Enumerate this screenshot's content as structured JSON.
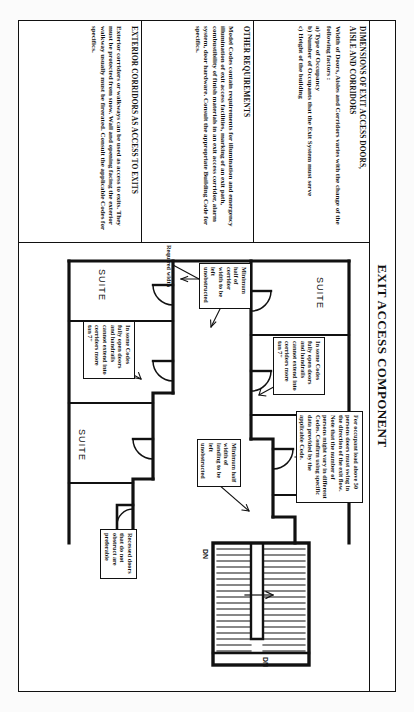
{
  "sheet": {
    "title": "EXIT ACCESS COMPONENT"
  },
  "columns": [
    {
      "id": "dimensions",
      "heading": "DIMENSIONS OF EXIT ACCESS DOORS,\nAISLE AND CORRIDORS",
      "heading_line1": "DIMENSIONS OF EXIT ACCESS DOORS,",
      "heading_line2": "AISLE AND CORRIDORS",
      "body": "Width of Doors, Aisles and Corridors varies with the change of the following factors :",
      "bullets": [
        "a) Type of Occupancy",
        "b) Number of Occupants that the Exit System  must serve",
        "c) Height of the building"
      ]
    },
    {
      "id": "other-requirements",
      "heading": "OTHER REQUIREMENTS",
      "body": "Model Codes contain requirements for illumination and emergency illumination of exit access facilities, marking of an exit path, combustibility of finish materials in an exit access corridor, alarm system, door hardware. Consult the appropriate Building Code for specifics."
    },
    {
      "id": "exterior-corridors",
      "heading": "EXTERIOR CORRIDORS AS ACCESS TO EXITS",
      "body": "Exterior corridors or walkways can be used as access to exits. They must be protected from snow. Wall and opening facing the exterior walkway usually must be firerated. Consult the applicable Codes for specifics."
    }
  ],
  "drawing": {
    "suites": [
      {
        "id": "suite-1",
        "label": "SUITE"
      },
      {
        "id": "suite-2",
        "label": "SUITE"
      },
      {
        "id": "suite-3",
        "label": "SUITE"
      },
      {
        "id": "suite-4",
        "label": "SUITE"
      },
      {
        "id": "suite-5",
        "label": "SUITE"
      },
      {
        "id": "suite-6",
        "label": "SUITE"
      }
    ],
    "callouts": [
      {
        "id": "occupant-load",
        "text": "For occupant load above 50 persons doors must swing in the direction of the exit flow. Note that the number of persons might vary in different Codes. Confirm using specific data provided by the applicable Code."
      },
      {
        "id": "open-doors-handrails-top",
        "text": "In some Codes fully open doors and handrails cannot extend into corridors more tan 7\""
      },
      {
        "id": "open-doors-handrails-bottom",
        "text": "In some Codes fully open doors and handrails cannot extend into corridors more tan 7\""
      },
      {
        "id": "corridor-half-width",
        "text": "Minimum half of corridor width to be left unobstructed"
      },
      {
        "id": "landing-half-width",
        "text": "Minimum half width of landing to be left unobstructed"
      },
      {
        "id": "recessed-doors",
        "text": "Recessed doors that do not obstruct are preferable"
      }
    ],
    "labels": [
      {
        "id": "required-width",
        "text": "Required width"
      },
      {
        "id": "stair-dn-left",
        "text": "DN"
      },
      {
        "id": "stair-dn-right",
        "text": "DN"
      }
    ]
  },
  "colors": {
    "ink": "#111111",
    "paper": "#ffffff",
    "page_background": "#fbfbfb"
  }
}
